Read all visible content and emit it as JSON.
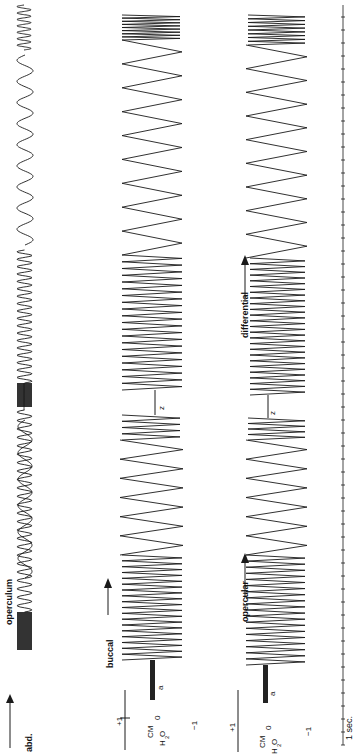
{
  "chart_data": {
    "type": "line",
    "orientation": "rotated-90-ccw",
    "title": "",
    "traces": [
      {
        "name": "opercular movement",
        "label": "operculum",
        "marker_label": "abd.",
        "unit": "",
        "segments": [
          {
            "phase": "fast",
            "cycles": 24,
            "note": "after stimulus bar"
          },
          {
            "phase": "slow",
            "cycles": 6
          },
          {
            "phase": "fast",
            "cycles": 18,
            "note": "after second stimulus bar"
          },
          {
            "phase": "slow",
            "cycles": 9
          },
          {
            "phase": "fast",
            "cycles": 6
          }
        ]
      },
      {
        "name": "buccal pressure",
        "label": "buccal",
        "unit": "CM H2O",
        "ylim": [
          -1,
          1
        ],
        "ticks": [
          "+1",
          "0",
          "-1"
        ],
        "event_labels": [
          "a",
          "z"
        ],
        "segments": [
          {
            "phase": "fast",
            "cycles": 18,
            "amplitude": 1.2
          },
          {
            "phase": "slow",
            "cycles": 6,
            "amplitude": 1.3
          },
          {
            "phase": "fast",
            "cycles": 4
          },
          {
            "phase": "fast",
            "cycles": 20,
            "amplitude": 1.3
          },
          {
            "phase": "slow",
            "cycles": 9,
            "amplitude": 1.3
          },
          {
            "phase": "fast",
            "cycles": 8
          }
        ]
      },
      {
        "name": "opercular / differential pressure",
        "label": "opercular",
        "label_2": "differential",
        "unit": "CM H2O",
        "ylim": [
          -1,
          1
        ],
        "ticks": [
          "+1",
          "0",
          "-1"
        ],
        "event_labels": [
          "a",
          "z"
        ],
        "segments": [
          {
            "phase": "fast",
            "cycles": 18
          },
          {
            "phase": "slow",
            "cycles": 6
          },
          {
            "phase": "fast",
            "cycles": 4
          },
          {
            "phase": "fast",
            "cycles": 24
          },
          {
            "phase": "slow",
            "cycles": 9
          },
          {
            "phase": "fast",
            "cycles": 8
          }
        ]
      }
    ],
    "time_marker": {
      "label": "1 sec.",
      "tick_interval_s": 1
    },
    "axes": {
      "ylabel_buccal": "CM H2O",
      "ylabel_opercular": "CM H2O",
      "grid": false
    }
  },
  "labels": {
    "operculum": "operculum",
    "abd": "abd.",
    "buccal": "buccal",
    "opercular": "opercular",
    "differential": "differential",
    "unit_cm": "CM",
    "unit_h2o": "H",
    "unit_sub2": "2",
    "unit_o": "O",
    "tick_p1": "+1",
    "tick_0": "0",
    "tick_m1": "−1",
    "event_a": "a",
    "event_z": "z",
    "time": "1 sec."
  },
  "colors": {
    "ink": "#1a1a1a",
    "background": "#ffffff"
  }
}
